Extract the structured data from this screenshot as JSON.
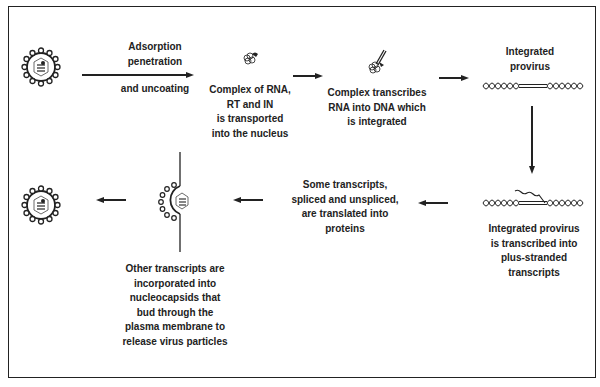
{
  "diagram": {
    "steps": {
      "adsorption": [
        "Adsorption",
        "penetration"
      ],
      "uncoating": "and uncoating",
      "complex": [
        "Complex of RNA,",
        "RT and IN",
        "is transported",
        "into the nucleus"
      ],
      "transcribes": [
        "Complex transcribes",
        "RNA into DNA which",
        "is integrated"
      ],
      "provirus": [
        "Integrated",
        "provirus"
      ],
      "plus_strand": [
        "Integrated provirus",
        "is transcribed into",
        "plus-stranded",
        "transcripts"
      ],
      "translated": [
        "Some transcripts,",
        "spliced and unspliced,",
        "are translated into",
        "proteins"
      ],
      "budding": [
        "Other transcripts are",
        "incorporated into",
        "nucleocapsids that",
        "bud through the",
        "plasma membrane to",
        "release virus particles"
      ]
    },
    "icons": [
      "virus-particle-icon",
      "rna-complex-icon",
      "reverse-transcription-complex-icon",
      "provirus-dna-icon",
      "transcribing-provirus-icon",
      "budding-virus-icon",
      "released-virus-icon"
    ],
    "colors": {
      "ink": "#222222",
      "background": "#ffffff"
    }
  }
}
